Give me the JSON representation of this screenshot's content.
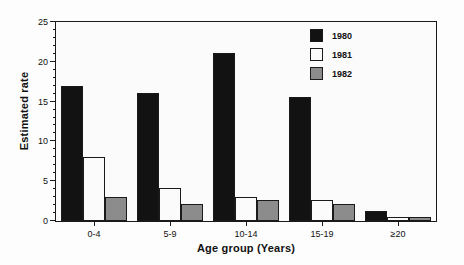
{
  "chart_data": {
    "type": "bar",
    "title": "",
    "xlabel": "Age group (Years)",
    "ylabel": "Estimated rate",
    "categories": [
      "0-4",
      "5-9",
      "10-14",
      "15-19",
      "≥20"
    ],
    "series": [
      {
        "name": "1980",
        "color": "#121212",
        "values": [
          17.0,
          16.1,
          21.1,
          15.6,
          1.2
        ]
      },
      {
        "name": "1981",
        "color": "#fbfbfb",
        "values": [
          8.0,
          4.1,
          3.0,
          2.6,
          0.5
        ]
      },
      {
        "name": "1982",
        "color": "#8c8c8c",
        "values": [
          3.0,
          2.1,
          2.7,
          2.1,
          0.5
        ]
      }
    ],
    "ylim": [
      0,
      25
    ],
    "yticks": [
      0,
      5,
      10,
      15,
      20,
      25
    ],
    "ytick_labels": [
      "0",
      "5",
      "10",
      "15",
      "20",
      "25"
    ],
    "yminor_step": 1,
    "grid": false,
    "legend_position": "top-right"
  }
}
